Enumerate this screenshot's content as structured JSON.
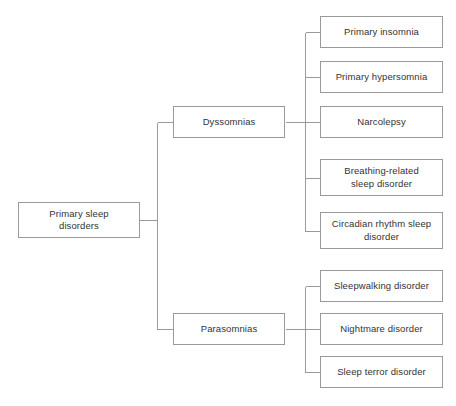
{
  "diagram": {
    "type": "tree",
    "orientation": "left-to-right",
    "title": "Primary sleep disorders",
    "colors": {
      "background": "#ffffff",
      "box_border": "#9a9a9a",
      "box_fill": "#ffffff",
      "connector": "#9a9a9a",
      "text": "#333333"
    },
    "root": {
      "id": "primary-sleep-disorders",
      "label": "Primary sleep\ndisorders",
      "x": 18,
      "y": 202,
      "w": 122,
      "h": 36
    },
    "branches": [
      {
        "id": "dyssomnias",
        "label": "Dyssomnias",
        "x": 173,
        "y": 106,
        "w": 112,
        "h": 32,
        "children": [
          {
            "id": "primary-insomnia",
            "label": "Primary insomnia",
            "x": 320,
            "y": 16,
            "w": 123,
            "h": 32
          },
          {
            "id": "primary-hypersomnia",
            "label": "Primary hypersomnia",
            "x": 320,
            "y": 61,
            "w": 123,
            "h": 32
          },
          {
            "id": "narcolepsy",
            "label": "Narcolepsy",
            "x": 320,
            "y": 106,
            "w": 123,
            "h": 32
          },
          {
            "id": "breathing-related-sleep-disorder",
            "label": "Breathing-related\nsleep disorder",
            "x": 320,
            "y": 159,
            "w": 123,
            "h": 37
          },
          {
            "id": "circadian-rhythm-sleep-disorder",
            "label": "Circadian rhythm sleep\ndisorder",
            "x": 320,
            "y": 212,
            "w": 123,
            "h": 37
          }
        ]
      },
      {
        "id": "parasomnias",
        "label": "Parasomnias",
        "x": 173,
        "y": 313,
        "w": 112,
        "h": 32,
        "children": [
          {
            "id": "sleepwalking-disorder",
            "label": "Sleepwalking disorder",
            "x": 320,
            "y": 270,
            "w": 123,
            "h": 32
          },
          {
            "id": "nightmare-disorder",
            "label": "Nightmare disorder",
            "x": 320,
            "y": 313,
            "w": 123,
            "h": 32
          },
          {
            "id": "sleep-terror-disorder",
            "label": "Sleep terror disorder",
            "x": 320,
            "y": 356,
            "w": 123,
            "h": 32
          }
        ]
      }
    ],
    "connectors": {
      "root_spine_x": 157,
      "branch_spine_x": 305
    }
  }
}
